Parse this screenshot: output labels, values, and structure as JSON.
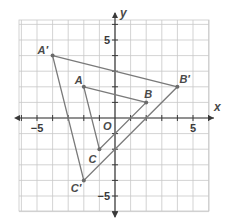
{
  "chart_data": {
    "type": "scatter",
    "title": "",
    "xlabel": "x",
    "ylabel": "y",
    "origin_label": "O",
    "xlim": [
      -6,
      6
    ],
    "ylim": [
      -6,
      6
    ],
    "grid": true,
    "tick_labels": {
      "x": [
        {
          "value": -5,
          "label": "−5"
        },
        {
          "value": 5,
          "label": "5"
        }
      ],
      "y": [
        {
          "value": 5,
          "label": "5"
        },
        {
          "value": -5,
          "label": "−5"
        }
      ]
    },
    "series": [
      {
        "name": "Triangle ABC",
        "closed": true,
        "points": [
          {
            "label": "A",
            "x": -2,
            "y": 2
          },
          {
            "label": "B",
            "x": 2,
            "y": 1
          },
          {
            "label": "C",
            "x": -1,
            "y": -2
          }
        ]
      },
      {
        "name": "Triangle A'B'C'",
        "closed": true,
        "points": [
          {
            "label": "A′",
            "x": -4,
            "y": 4
          },
          {
            "label": "B′",
            "x": 4,
            "y": 2
          },
          {
            "label": "C′",
            "x": -2,
            "y": -4
          }
        ]
      }
    ]
  },
  "colors": {
    "grid": "#c8c8c8",
    "axis": "#3a3a3a",
    "triangle": "#7a7a7a",
    "point": "#6a6a6a"
  }
}
